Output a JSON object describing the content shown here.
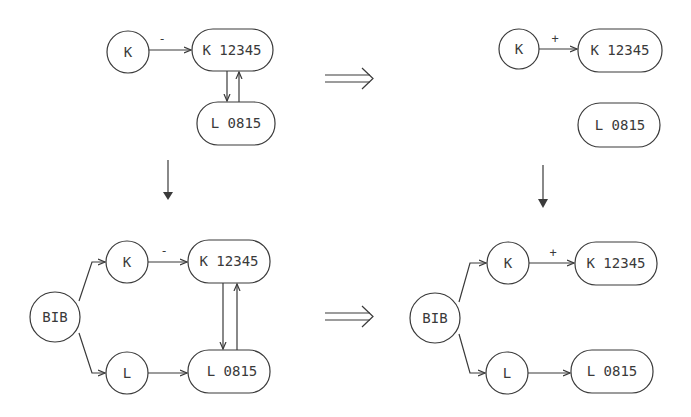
{
  "diagram": {
    "panels": [
      {
        "id": "top-left",
        "nodes": [
          {
            "id": "K",
            "label": "K",
            "shape": "circle"
          },
          {
            "id": "K12345",
            "label": "K 12345",
            "shape": "pill"
          },
          {
            "id": "L0815",
            "label": "L 0815",
            "shape": "pill"
          }
        ],
        "edges": [
          {
            "from": "K",
            "to": "K12345",
            "label": "-"
          },
          {
            "from": "K12345",
            "to": "L0815",
            "label": ""
          },
          {
            "from": "L0815",
            "to": "K12345",
            "label": ""
          }
        ]
      },
      {
        "id": "top-right",
        "nodes": [
          {
            "id": "K",
            "label": "K",
            "shape": "circle"
          },
          {
            "id": "K12345",
            "label": "K 12345",
            "shape": "pill"
          },
          {
            "id": "L0815",
            "label": "L 0815",
            "shape": "pill"
          }
        ],
        "edges": [
          {
            "from": "K",
            "to": "K12345",
            "label": "+"
          }
        ]
      },
      {
        "id": "bottom-left",
        "nodes": [
          {
            "id": "BIB",
            "label": "BIB",
            "shape": "circle"
          },
          {
            "id": "K",
            "label": "K",
            "shape": "circle"
          },
          {
            "id": "L",
            "label": "L",
            "shape": "circle"
          },
          {
            "id": "K12345",
            "label": "K 12345",
            "shape": "pill"
          },
          {
            "id": "L0815",
            "label": "L 0815",
            "shape": "pill"
          }
        ],
        "edges": [
          {
            "from": "BIB",
            "to": "K",
            "label": ""
          },
          {
            "from": "BIB",
            "to": "L",
            "label": ""
          },
          {
            "from": "K",
            "to": "K12345",
            "label": "-"
          },
          {
            "from": "L",
            "to": "L0815",
            "label": ""
          },
          {
            "from": "K12345",
            "to": "L0815",
            "label": ""
          },
          {
            "from": "L0815",
            "to": "K12345",
            "label": ""
          }
        ]
      },
      {
        "id": "bottom-right",
        "nodes": [
          {
            "id": "BIB",
            "label": "BIB",
            "shape": "circle"
          },
          {
            "id": "K",
            "label": "K",
            "shape": "circle"
          },
          {
            "id": "L",
            "label": "L",
            "shape": "circle"
          },
          {
            "id": "K12345",
            "label": "K 12345",
            "shape": "pill"
          },
          {
            "id": "L0815",
            "label": "L 0815",
            "shape": "pill"
          }
        ],
        "edges": [
          {
            "from": "BIB",
            "to": "K",
            "label": ""
          },
          {
            "from": "BIB",
            "to": "L",
            "label": ""
          },
          {
            "from": "K",
            "to": "K12345",
            "label": "+"
          },
          {
            "from": "L",
            "to": "L0815",
            "label": ""
          }
        ]
      }
    ],
    "transitions": [
      {
        "from": "top-left",
        "to": "top-right",
        "symbol": "implies"
      },
      {
        "from": "bottom-left",
        "to": "bottom-right",
        "symbol": "implies"
      },
      {
        "from": "top-left",
        "to": "bottom-left",
        "symbol": "down-arrow"
      },
      {
        "from": "top-right",
        "to": "bottom-right",
        "symbol": "down-arrow"
      }
    ],
    "colors": {
      "stroke": "#3a3a3a",
      "background": "#ffffff"
    }
  }
}
